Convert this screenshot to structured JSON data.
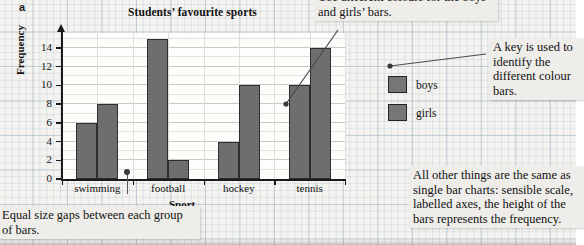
{
  "part_letter": "a",
  "chart_data": {
    "type": "bar",
    "title": "Students’ favourite sports",
    "xlabel": "Sport",
    "ylabel": "Frequency",
    "categories": [
      "swimming",
      "football",
      "hockey",
      "tennis"
    ],
    "series": [
      {
        "name": "boys",
        "values": [
          6,
          15,
          4,
          10
        ],
        "color": "#6e6e6e"
      },
      {
        "name": "girls",
        "values": [
          8,
          2,
          10,
          14
        ],
        "color": "#6e6e6e"
      }
    ],
    "ylim": [
      0,
      15
    ],
    "yticks": [
      0,
      2,
      4,
      6,
      8,
      10,
      12,
      14
    ],
    "ytick_labels": [
      "0",
      "2",
      "4",
      "6",
      "8",
      "10",
      "12",
      "14"
    ],
    "grid": true,
    "legend_position": "right"
  },
  "legend": {
    "items": [
      {
        "label": "boys",
        "color": "#6e6e6e"
      },
      {
        "label": "girls",
        "color": "#6e6e6e"
      }
    ]
  },
  "callouts": {
    "colours": "Use different colours for the boys’ and girls’ bars.",
    "key": "A key is used to identify the different colour bars.",
    "gaps": "Equal size gaps between each group of bars.",
    "other": "All other things are the same as single bar charts: sensible scale, labelled axes, the height of the bars represents the frequency."
  }
}
